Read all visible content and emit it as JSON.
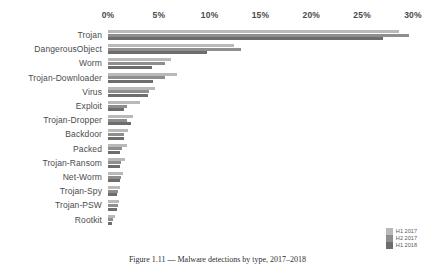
{
  "chart_data": {
    "type": "bar",
    "orientation": "horizontal",
    "title": "",
    "xlabel": "",
    "ylabel": "",
    "xlim": [
      0,
      30
    ],
    "xunit": "%",
    "grid": false,
    "legend_position": "bottom-right",
    "axis_position": "top",
    "tick_labels": [
      "0%",
      "5%",
      "10%",
      "15%",
      "20%",
      "25%",
      "30%"
    ],
    "tick_values": [
      0,
      5,
      10,
      15,
      20,
      25,
      30
    ],
    "categories": [
      "Trojan",
      "DangerousObject",
      "Worm",
      "Trojan-Downloader",
      "Virus",
      "Exploit",
      "Trojan-Dropper",
      "Backdoor",
      "Packed",
      "Trojan-Ransom",
      "Net-Worm",
      "Trojan-Spy",
      "Trojan-PSW",
      "Rootkit"
    ],
    "series": [
      {
        "name": "H1 2017",
        "color": "#b9b9b9",
        "values": [
          28.6,
          12.4,
          6.2,
          6.8,
          4.6,
          3.1,
          2.5,
          2.0,
          1.9,
          1.7,
          1.5,
          1.2,
          1.1,
          0.7
        ]
      },
      {
        "name": "H2 2017",
        "color": "#8e8e8e",
        "values": [
          29.6,
          13.1,
          5.6,
          5.6,
          4.0,
          1.9,
          1.9,
          1.6,
          1.4,
          1.3,
          1.3,
          1.0,
          1.0,
          0.5
        ]
      },
      {
        "name": "H1 2018",
        "color": "#6d6d6d",
        "values": [
          27.0,
          9.7,
          4.3,
          4.4,
          3.9,
          1.6,
          2.3,
          1.6,
          1.2,
          1.2,
          1.2,
          0.9,
          0.9,
          0.4
        ]
      }
    ]
  },
  "legend": {
    "items": [
      {
        "label": "H1 2017",
        "color": "#b9b9b9"
      },
      {
        "label": "H2 2017",
        "color": "#8e8e8e"
      },
      {
        "label": "H1 2018",
        "color": "#6d6d6d"
      }
    ]
  },
  "caption": {
    "text": "Figure 1.11 — Malware detections by type, 2017–2018"
  }
}
